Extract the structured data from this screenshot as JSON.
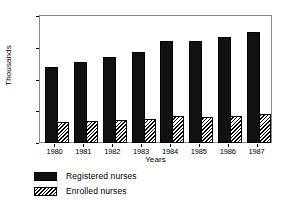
{
  "chart_data": {
    "type": "bar",
    "title": "",
    "subtitle": "",
    "xlabel": "Years",
    "ylabel": "Thousands",
    "categories": [
      "1980",
      "1981",
      "1982",
      "1983",
      "1984",
      "1985",
      "1986",
      "1987"
    ],
    "series": [
      {
        "name": "Registered nurses",
        "fill": "solid-black",
        "color": "#111111",
        "values": [
          12.0,
          12.7,
          13.5,
          14.4,
          16.0,
          16.0,
          16.7,
          17.5
        ]
      },
      {
        "name": "Enrolled nurses",
        "fill": "diagonal-hatch",
        "color": "#ffffff",
        "values": [
          3.3,
          3.4,
          3.6,
          3.8,
          4.2,
          4.1,
          4.3,
          4.6
        ]
      }
    ],
    "ylim": [
      0,
      20
    ],
    "yticks": [
      0,
      5,
      10,
      15,
      20
    ],
    "ytick_labels": [
      "0",
      "5",
      "10",
      "15",
      "20"
    ],
    "grid": false,
    "legend_position": "below-left",
    "legend": [
      "Registered nurses",
      "Enrolled nurses"
    ],
    "frame": true
  }
}
